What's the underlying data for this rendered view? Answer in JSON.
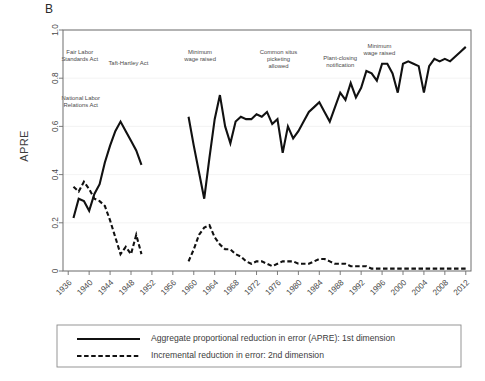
{
  "figure": {
    "panel_label": "B",
    "ylabel": "APRE"
  },
  "chart_data": {
    "type": "line",
    "title": "",
    "panel": "B",
    "xlabel": "",
    "ylabel": "APRE",
    "xlim": [
      1935,
      2013
    ],
    "ylim": [
      0,
      1.0
    ],
    "grid": true,
    "legend_position": "below-plot",
    "xticks": [
      1936,
      1940,
      1944,
      1948,
      1952,
      1956,
      1960,
      1964,
      1968,
      1972,
      1976,
      1980,
      1984,
      1988,
      1992,
      1996,
      2000,
      2004,
      2008,
      2012
    ],
    "xtick_labels": [
      "1936",
      "1940",
      "1944",
      "1948",
      "1952",
      "1956",
      "1960",
      "1964",
      "1968",
      "1972",
      "1976",
      "1980",
      "1984",
      "1988",
      "1992",
      "1996",
      "2000",
      "2004",
      "2008",
      "2012"
    ],
    "yticks": [
      0,
      0.2,
      0.4,
      0.6,
      0.8,
      1.0
    ],
    "ytick_labels": [
      "0",
      "0.2",
      "0.4",
      "0.6",
      "0.8",
      "1.0"
    ],
    "series": [
      {
        "name": "Aggregate proportional reduction in error (APRE): 1st dimension",
        "style": "solid",
        "color": "#111111",
        "segments": [
          {
            "x": [
              1937,
              1938,
              1939,
              1940,
              1941,
              1942,
              1943,
              1944,
              1945,
              1946,
              1947,
              1948,
              1949,
              1950
            ],
            "y": [
              0.22,
              0.3,
              0.29,
              0.25,
              0.32,
              0.36,
              0.45,
              0.52,
              0.58,
              0.62,
              0.58,
              0.54,
              0.5,
              0.44
            ]
          },
          {
            "x": [
              1959,
              1960,
              1961,
              1962,
              1963,
              1964,
              1965,
              1966,
              1967,
              1968,
              1969,
              1970,
              1971,
              1972,
              1973,
              1974,
              1975,
              1976,
              1977,
              1978,
              1979,
              1980,
              1981,
              1982,
              1983,
              1984,
              1985,
              1986,
              1987,
              1988,
              1989,
              1990,
              1991,
              1992,
              1993,
              1994,
              1995,
              1996,
              1997,
              1998,
              1999,
              2000,
              2001,
              2002,
              2003,
              2004,
              2005,
              2006,
              2007,
              2008,
              2009,
              2010,
              2011,
              2012
            ],
            "y": [
              0.64,
              0.52,
              0.41,
              0.3,
              0.47,
              0.63,
              0.73,
              0.6,
              0.53,
              0.62,
              0.64,
              0.63,
              0.63,
              0.65,
              0.64,
              0.66,
              0.61,
              0.63,
              0.49,
              0.6,
              0.55,
              0.58,
              0.62,
              0.66,
              0.68,
              0.7,
              0.66,
              0.62,
              0.68,
              0.74,
              0.71,
              0.78,
              0.72,
              0.76,
              0.83,
              0.82,
              0.79,
              0.86,
              0.86,
              0.82,
              0.74,
              0.86,
              0.87,
              0.86,
              0.85,
              0.74,
              0.85,
              0.88,
              0.87,
              0.88,
              0.87,
              0.89,
              0.91,
              0.93
            ]
          }
        ]
      },
      {
        "name": "Incremental reduction in error: 2nd dimension",
        "style": "dashed",
        "color": "#111111",
        "segments": [
          {
            "x": [
              1937,
              1938,
              1939,
              1940,
              1941,
              1942,
              1943,
              1944,
              1945,
              1946,
              1947,
              1948,
              1949,
              1950
            ],
            "y": [
              0.35,
              0.33,
              0.37,
              0.34,
              0.3,
              0.29,
              0.27,
              0.21,
              0.14,
              0.07,
              0.1,
              0.07,
              0.15,
              0.07
            ]
          },
          {
            "x": [
              1959,
              1960,
              1961,
              1962,
              1963,
              1964,
              1965,
              1966,
              1967,
              1968,
              1969,
              1970,
              1971,
              1972,
              1973,
              1974,
              1975,
              1976,
              1977,
              1978,
              1979,
              1980,
              1981,
              1982,
              1983,
              1984,
              1985,
              1986,
              1987,
              1988,
              1989,
              1990,
              1991,
              1992,
              1993,
              1994,
              1995,
              1996,
              1997,
              1998,
              1999,
              2000,
              2001,
              2002,
              2003,
              2004,
              2005,
              2006,
              2007,
              2008,
              2009,
              2010,
              2011,
              2012
            ],
            "y": [
              0.04,
              0.09,
              0.15,
              0.18,
              0.19,
              0.14,
              0.11,
              0.09,
              0.09,
              0.07,
              0.06,
              0.04,
              0.03,
              0.04,
              0.04,
              0.03,
              0.02,
              0.03,
              0.04,
              0.04,
              0.04,
              0.03,
              0.03,
              0.03,
              0.04,
              0.05,
              0.05,
              0.04,
              0.03,
              0.03,
              0.03,
              0.02,
              0.02,
              0.02,
              0.02,
              0.01,
              0.01,
              0.01,
              0.01,
              0.01,
              0.01,
              0.01,
              0.01,
              0.01,
              0.01,
              0.01,
              0.01,
              0.01,
              0.01,
              0.01,
              0.01,
              0.01,
              0.01,
              0.01
            ]
          }
        ]
      }
    ],
    "annotations": [
      {
        "id": "fair-labor-standards-act",
        "lines": [
          "Fair Labor",
          "Standards Act"
        ],
        "x": 1938.2,
        "y": 0.9
      },
      {
        "id": "national-labor-relations-act",
        "lines": [
          "National Labor",
          "Relations Act"
        ],
        "x": 1938.4,
        "y": 0.71
      },
      {
        "id": "taft-hartley-act",
        "lines": [
          "Taft-Hartley Act"
        ],
        "x": 1947.5,
        "y": 0.855
      },
      {
        "id": "minimum-wage-raised-1",
        "lines": [
          "Minimum",
          "wage raised"
        ],
        "x": 1961.2,
        "y": 0.9
      },
      {
        "id": "common-situs-picketing-allowed",
        "lines": [
          "Common situs",
          "picketing",
          "allowed"
        ],
        "x": 1976.2,
        "y": 0.9
      },
      {
        "id": "plant-closing-notification",
        "lines": [
          "Plant-closing",
          "notification"
        ],
        "x": 1988.0,
        "y": 0.875
      },
      {
        "id": "minimum-wage-raised-2",
        "lines": [
          "Minimum",
          "wage raised"
        ],
        "x": 1995.5,
        "y": 0.925
      }
    ]
  },
  "legend": {
    "items": [
      {
        "label": "Aggregate proportional reduction in error (APRE): 1st dimension",
        "style": "solid"
      },
      {
        "label": "Incremental reduction in error: 2nd dimension",
        "style": "dashed"
      }
    ]
  }
}
